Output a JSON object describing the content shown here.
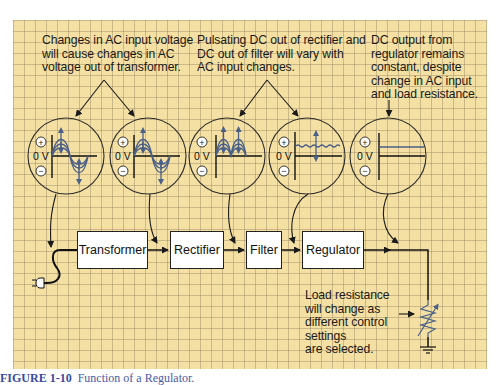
{
  "notes": {
    "ac_input": "Changes in AC input voltage\nwill cause changes in AC\nvoltage out of transformer.",
    "pulsating_dc": "Pulsating DC out of rectifier and\nDC out of filter will vary with\nAC input changes.",
    "dc_output": "DC output from\nregulator remains\nconstant, despite\nchange in AC input\nand load resistance.",
    "load": "Load resistance\nwill change as\ndifferent control\nsettings\nare selected."
  },
  "blocks": [
    {
      "id": "transformer",
      "label": "Transformer"
    },
    {
      "id": "rectifier",
      "label": "Rectifier"
    },
    {
      "id": "filter",
      "label": "Filter"
    },
    {
      "id": "regulator",
      "label": "Regulator"
    }
  ],
  "scopes": [
    {
      "id": "ac-input",
      "waveform": "sine-varying",
      "zero_label": "0 V",
      "plus": "+",
      "minus": "−"
    },
    {
      "id": "transformer-out",
      "waveform": "sine-varying",
      "zero_label": "0 V",
      "plus": "+",
      "minus": "−"
    },
    {
      "id": "rectifier-out",
      "waveform": "full-wave-rectified-varying",
      "zero_label": "0 V",
      "plus": "+",
      "minus": "−"
    },
    {
      "id": "filter-out",
      "waveform": "ripple-dc-varying",
      "zero_label": "0 V",
      "plus": "+",
      "minus": "−"
    },
    {
      "id": "regulator-out",
      "waveform": "constant-dc",
      "zero_label": "0 V",
      "plus": "+",
      "minus": "−"
    }
  ],
  "icons": {
    "plug": "power-plug-icon",
    "load": "variable-resistor-icon",
    "ground": "ground-icon"
  },
  "colors": {
    "grid_background": "#f5e0a3",
    "grid_line": "#b8a784",
    "waveform": "#4a6088",
    "line": "#222222",
    "caption": "#4a5aa8"
  },
  "caption": {
    "label": "FIGURE 1-10",
    "text": "Function of a Regulator."
  }
}
